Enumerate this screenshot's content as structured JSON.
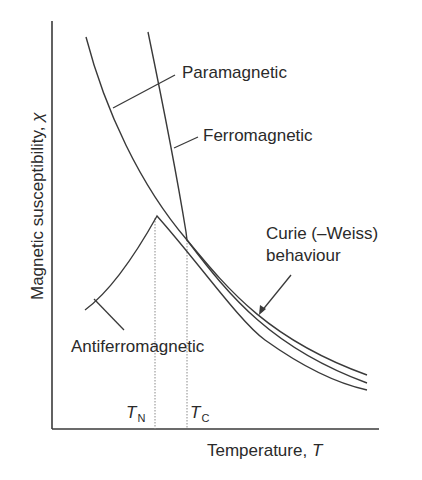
{
  "diagram": {
    "type": "magnetic susceptibility vs temperature",
    "axes": {
      "y_label": "Magnetic susceptibility, ",
      "y_symbol": "χ",
      "x_label": "Temperature, ",
      "x_symbol": "T"
    },
    "markers": {
      "neel": {
        "symbol": "T",
        "subscript": "N"
      },
      "curie": {
        "symbol": "T",
        "subscript": "C"
      }
    },
    "labels": {
      "paramagnetic": "Paramagnetic",
      "ferromagnetic": "Ferromagnetic",
      "curie_weiss_line1": "Curie (–Weiss)",
      "curie_weiss_line2": "behaviour",
      "antiferromagnetic": "Antiferromagnetic"
    },
    "colors": {
      "line": "#3a3a3a",
      "dotted": "#8a8a8a",
      "text": "#2a2a2a"
    }
  }
}
